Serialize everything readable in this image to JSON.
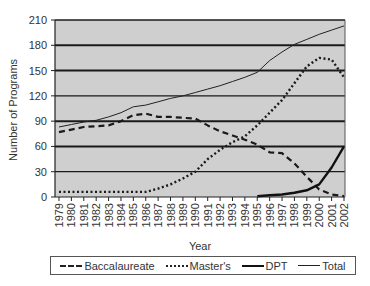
{
  "chart_data": {
    "type": "line",
    "title": "",
    "xlabel": "Year",
    "ylabel": "Number of Programs",
    "ylim": [
      0,
      210
    ],
    "yticks": [
      0,
      30,
      60,
      90,
      120,
      150,
      180,
      210
    ],
    "grid": true,
    "legend_position": "bottom",
    "categories": [
      "1979",
      "1980",
      "1981",
      "1982",
      "1983",
      "1984",
      "1985",
      "1986",
      "1987",
      "1988",
      "1989",
      "1990",
      "1991",
      "1992",
      "1993",
      "1994",
      "1995",
      "1996",
      "1997",
      "1998",
      "1999",
      "2000",
      "2001",
      "2002"
    ],
    "series": [
      {
        "name": "Baccalaureate",
        "style": "dashed",
        "values": [
          77,
          80,
          83,
          84,
          85,
          90,
          97,
          99,
          95,
          95,
          94,
          93,
          85,
          78,
          73,
          68,
          62,
          53,
          52,
          40,
          24,
          9,
          3,
          1
        ]
      },
      {
        "name": "Master's",
        "style": "dotted",
        "values": [
          6,
          6,
          6,
          6,
          6,
          6,
          6,
          6,
          10,
          15,
          22,
          30,
          45,
          56,
          65,
          72,
          85,
          100,
          115,
          135,
          155,
          165,
          163,
          142
        ]
      },
      {
        "name": "DPT",
        "style": "thick-solid",
        "values": [
          null,
          null,
          null,
          null,
          null,
          null,
          null,
          null,
          null,
          null,
          null,
          null,
          null,
          null,
          null,
          null,
          1,
          2,
          3,
          5,
          8,
          15,
          35,
          60
        ]
      },
      {
        "name": "Total",
        "style": "thin-solid",
        "values": [
          83,
          86,
          89,
          91,
          95,
          100,
          107,
          109,
          113,
          117,
          120,
          124,
          128,
          132,
          137,
          142,
          148,
          162,
          172,
          181,
          187,
          193,
          198,
          203
        ]
      }
    ]
  },
  "legend": {
    "items": [
      {
        "label": "Baccalaureate"
      },
      {
        "label": "Master's"
      },
      {
        "label": "DPT"
      },
      {
        "label": "Total"
      }
    ]
  }
}
